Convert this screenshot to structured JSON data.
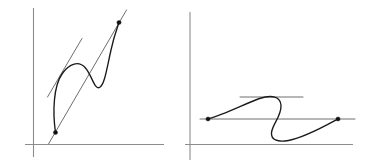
{
  "figure": {
    "background_color": "#ffffff",
    "width": 368,
    "height": 165,
    "colors": {
      "axis": "#8c8c8c",
      "curve": "#1a1a1a",
      "secant": "#6e6e6e",
      "tangent": "#6e6e6e",
      "endpoint": "#111111"
    }
  },
  "panels": [
    {
      "name": "left-panel",
      "label": "",
      "axes": {
        "y_axis": {
          "x": 33.5,
          "y_top": 8,
          "y_bottom": 157
        },
        "x_axis": {
          "y": 144.5,
          "x_left": 25,
          "x_right": 164
        }
      },
      "curve": {
        "description": "S-shaped cubic-like curve rising steeply, plateauing, dipping, then rising steeply again",
        "path": "M 55.5 132.5 C 52.5 112 53.5 86 62 74 C 69.5 63 79 60.5 85.5 68 C 92 75.5 94.5 90 99.5 87.5 C 104.5 85 106.5 70 111 50 C 114 36 117.5 27 119 22.5"
      },
      "secant": {
        "description": "Secant line through the two marked endpoints, extended beyond both",
        "x1": 48.5,
        "y1": 144.0,
        "x2": 126.5,
        "y2": 10.0
      },
      "tangent": {
        "description": "Tangent line parallel to the secant, touching the curve at an interior point",
        "x1": 47.5,
        "y1": 97.0,
        "x2": 82.0,
        "y2": 38.5
      },
      "endpoints": [
        {
          "name": "left-endpoint",
          "x": 55.5,
          "y": 132.5,
          "r": 2.1
        },
        {
          "name": "right-endpoint",
          "x": 119.0,
          "y": 22.5,
          "r": 2.1
        }
      ]
    },
    {
      "name": "right-panel",
      "label": "",
      "axes": {
        "y_axis": {
          "x": 190.0,
          "y_top": 12,
          "y_bottom": 160
        },
        "x_axis": {
          "y": 144.5,
          "x_left": 185,
          "x_right": 353
        }
      },
      "curve": {
        "description": "Curve rising from left endpoint to a rounded maximum, descending through an inflection to a minimum, then rising to the right endpoint",
        "path": "M 208.0 119.0 C 224.5 114.5 245.5 103.5 259.5 98.5 C 272.0 94.5 280.5 96.5 281.0 105.5 C 281.5 116.5 272.0 124.5 271.5 133.0 C 271.0 139.5 277.0 142.5 288.5 140.5 C 305.0 137.5 326.0 125.5 338.0 119.0"
      },
      "secant": {
        "description": "Horizontal secant line through the two marked endpoints, extended beyond both",
        "x1": 200.0,
        "y1": 119.0,
        "x2": 355.0,
        "y2": 119.0
      },
      "tangent": {
        "description": "Horizontal tangent line at the rounded maximum of the curve",
        "x1": 240.0,
        "y1": 97.0,
        "x2": 303.0,
        "y2": 97.0
      },
      "endpoints": [
        {
          "name": "left-endpoint",
          "x": 208.0,
          "y": 119.0,
          "r": 2.1
        },
        {
          "name": "right-endpoint",
          "x": 338.0,
          "y": 119.0,
          "r": 2.1
        }
      ]
    }
  ]
}
